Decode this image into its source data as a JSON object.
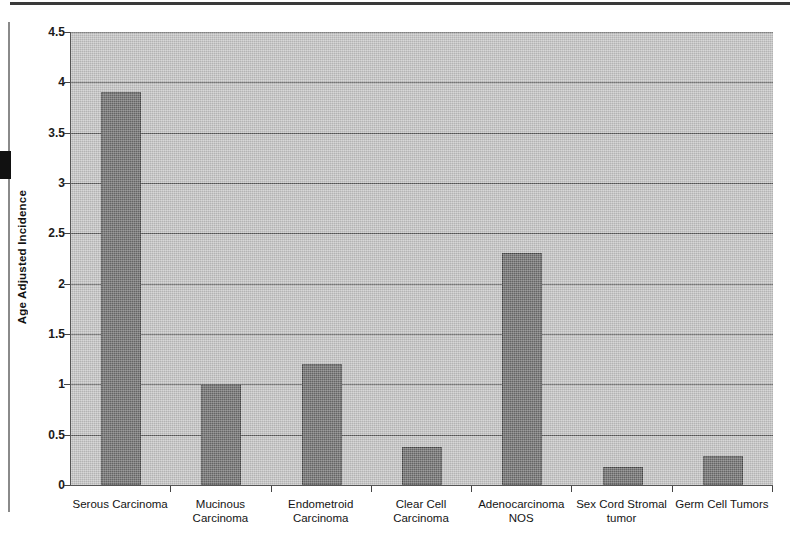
{
  "chart_data": {
    "type": "bar",
    "title": "",
    "xlabel": "",
    "ylabel": "Age Adjusted Incidence",
    "ylim": [
      0,
      4.5
    ],
    "ytick_step": 0.5,
    "yticks": [
      "0",
      "0.5",
      "1",
      "1.5",
      "2",
      "2.5",
      "3",
      "3.5",
      "4",
      "4.5"
    ],
    "grid": true,
    "legend": false,
    "orientation": "vertical",
    "categories": [
      "Serous Carcinoma",
      "Mucinous\nCarcinoma",
      "Endometroid\nCarcinoma",
      "Clear Cell\nCarcinoma",
      "Adenocarcinoma\nNOS",
      "Sex Cord Stromal\ntumor",
      "Germ Cell Tumors"
    ],
    "values": [
      3.9,
      1.0,
      1.2,
      0.38,
      2.3,
      0.18,
      0.29
    ],
    "colors": {
      "bar_fill": "#6f6f6f",
      "bar_border": "#4a4a4a",
      "plot_background": "#c6c6c6",
      "gridline": "#5c5c5c",
      "axis": "#555555",
      "text": "#141414"
    }
  },
  "artifacts": {
    "top_rule": "scan-rule-top",
    "left_rule": "scan-rule-left",
    "left_block": "scan-black-block"
  }
}
